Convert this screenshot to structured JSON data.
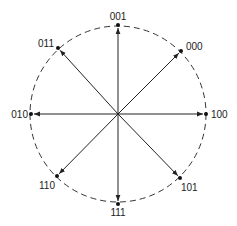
{
  "diagram": {
    "type": "8-PSK constellation",
    "center": [
      118,
      114
    ],
    "radius": 88,
    "points": [
      {
        "label": "001",
        "x": 118,
        "y": 25,
        "lx": 118,
        "ly": 20,
        "anchor": "middle"
      },
      {
        "label": "000",
        "x": 181,
        "y": 51,
        "lx": 186,
        "ly": 50,
        "anchor": "start"
      },
      {
        "label": "100",
        "x": 206,
        "y": 114,
        "lx": 211,
        "ly": 118,
        "anchor": "start"
      },
      {
        "label": "101",
        "x": 180,
        "y": 178,
        "lx": 181,
        "ly": 191,
        "anchor": "start"
      },
      {
        "label": "111",
        "x": 118,
        "y": 204,
        "lx": 118,
        "ly": 216,
        "anchor": "middle"
      },
      {
        "label": "110",
        "x": 57,
        "y": 176,
        "lx": 55,
        "ly": 189,
        "anchor": "end"
      },
      {
        "label": "010",
        "x": 31,
        "y": 114,
        "lx": 28,
        "ly": 118,
        "anchor": "end"
      },
      {
        "label": "011",
        "x": 58,
        "y": 48,
        "lx": 54,
        "ly": 47,
        "anchor": "end"
      }
    ],
    "colors": {
      "line": "#222222",
      "circle": "#333333"
    }
  }
}
